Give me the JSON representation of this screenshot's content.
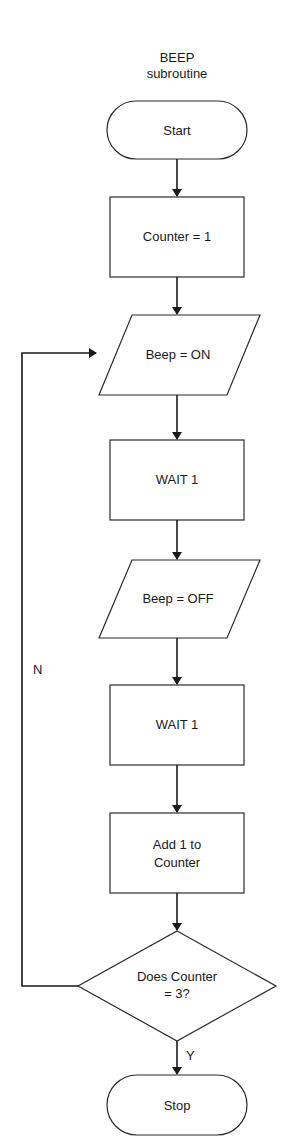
{
  "title": {
    "line1": "BEEP",
    "line2": "subroutine"
  },
  "nodes": [
    {
      "id": "start",
      "type": "terminal",
      "label": "Start"
    },
    {
      "id": "counter-init",
      "type": "process",
      "label": "Counter = 1"
    },
    {
      "id": "beep-on",
      "type": "io",
      "label": "Beep = ON"
    },
    {
      "id": "wait-1a",
      "type": "process",
      "label": "WAIT 1"
    },
    {
      "id": "beep-off",
      "type": "io",
      "label": "Beep = OFF"
    },
    {
      "id": "wait-1b",
      "type": "process",
      "label": "WAIT 1"
    },
    {
      "id": "add-counter",
      "type": "process",
      "label_line1": "Add 1 to",
      "label_line2": "Counter"
    },
    {
      "id": "decision",
      "type": "decision",
      "label_line1": "Does Counter",
      "label_line2": "= 3?"
    },
    {
      "id": "stop",
      "type": "terminal",
      "label": "Stop"
    }
  ],
  "edges": {
    "no_label": "N",
    "yes_label": "Y"
  },
  "colors": {
    "stroke": "#1a1a1a",
    "fill": "#ffffff"
  }
}
